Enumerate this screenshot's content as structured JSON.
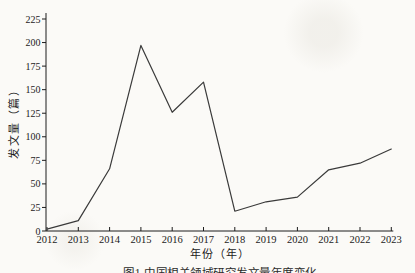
{
  "figure": {
    "y_axis_title": "发文量（篇）",
    "x_axis_title": "年份（年）",
    "caption": "图1 中国相关领域研究发文量年度变化"
  },
  "chart_data": {
    "type": "line",
    "title": "",
    "xlabel": "年份（年）",
    "ylabel": "发文量（篇）",
    "x": [
      2012,
      2013,
      2014,
      2015,
      2016,
      2017,
      2018,
      2019,
      2020,
      2021,
      2022,
      2023
    ],
    "series": [
      {
        "name": "发文量",
        "values": [
          2,
          11,
          66,
          197,
          126,
          158,
          21,
          31,
          36,
          65,
          72,
          87
        ]
      }
    ],
    "ylim": [
      0,
      225
    ],
    "ytick_step": 25,
    "yticks": [
      0,
      25,
      50,
      75,
      100,
      125,
      150,
      175,
      200,
      225
    ],
    "grid": false,
    "legend": "none",
    "line_color": "#3a3a3a",
    "axis_color": "#1c1c1c",
    "background": "#fbfaf7"
  }
}
